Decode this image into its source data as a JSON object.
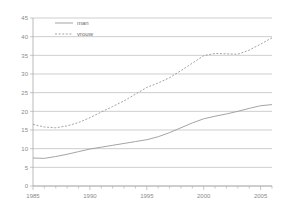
{
  "chart_data": {
    "type": "line",
    "title": "",
    "subtitle": "",
    "xlabel": "",
    "ylabel": "",
    "xlim": [
      1985,
      2006
    ],
    "ylim": [
      0,
      45
    ],
    "ytick_step": 5,
    "xtick_step": 5,
    "grid": true,
    "grid_axis": "y",
    "legend_position": "top-left",
    "x": [
      1985,
      1986,
      1987,
      1988,
      1989,
      1990,
      1991,
      1992,
      1993,
      1994,
      1995,
      1996,
      1997,
      1998,
      1999,
      2000,
      2001,
      2002,
      2003,
      2004,
      2005,
      2006
    ],
    "series": [
      {
        "name": "man",
        "style": "solid",
        "color": "#9a9a9a",
        "values": [
          7.5,
          7.4,
          7.9,
          8.5,
          9.2,
          9.9,
          10.4,
          10.9,
          11.4,
          11.9,
          12.4,
          13.2,
          14.3,
          15.6,
          16.9,
          18.0,
          18.7,
          19.3,
          20.0,
          20.8,
          21.5,
          21.8
        ]
      },
      {
        "name": "vrouw",
        "style": "dotted",
        "color": "#9a9a9a",
        "values": [
          16.5,
          15.8,
          15.6,
          16.1,
          17.0,
          18.3,
          19.8,
          21.3,
          22.8,
          24.6,
          26.4,
          27.6,
          29.0,
          30.9,
          32.9,
          34.9,
          35.5,
          35.4,
          35.3,
          36.4,
          38.0,
          39.7
        ]
      }
    ],
    "ytick_labels": [
      "0",
      "5",
      "10",
      "15",
      "20",
      "25",
      "30",
      "35",
      "40",
      "45"
    ],
    "ytick_values": [
      0,
      5,
      10,
      15,
      20,
      25,
      30,
      35,
      40,
      45
    ],
    "xtick_labels": [
      "1985",
      "1990",
      "1995",
      "2000",
      "2005"
    ],
    "xtick_values": [
      1985,
      1990,
      1995,
      2000,
      2005
    ],
    "minor_xticks": [
      1986,
      1987,
      1988,
      1989,
      1991,
      1992,
      1993,
      1994,
      1996,
      1997,
      1998,
      1999,
      2001,
      2002,
      2003,
      2004,
      2006
    ]
  },
  "legend": {
    "items": [
      {
        "label": "man"
      },
      {
        "label": "vrouw"
      }
    ]
  },
  "colors": {
    "grid": "#b9b9b9",
    "axis": "#a8a8a8",
    "text": "#8a8a8a",
    "series": "#9a9a9a"
  }
}
